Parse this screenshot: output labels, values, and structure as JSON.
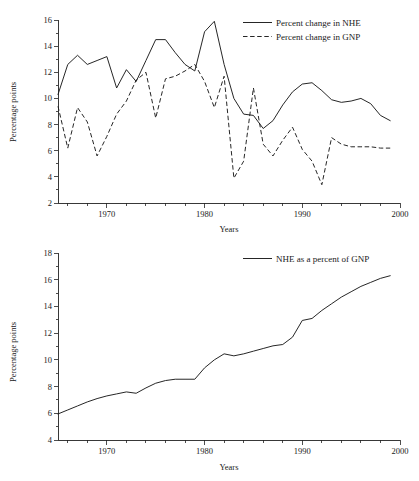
{
  "page": {
    "background": "#ffffff",
    "ink": "#1a1a1a",
    "partial_title_top": ""
  },
  "chart_data": [
    {
      "id": "top",
      "type": "line",
      "title": "",
      "xlabel": "Years",
      "ylabel": "Percentage points",
      "xlim": [
        1965,
        2000
      ],
      "ylim": [
        2,
        16
      ],
      "yticks": [
        2,
        4,
        6,
        8,
        10,
        12,
        14,
        16
      ],
      "xticks_major": [
        1970,
        1980,
        1990,
        2000
      ],
      "xticks_minor_step": 2,
      "grid": false,
      "legend_position": "top-right",
      "x": [
        1965,
        1966,
        1967,
        1968,
        1969,
        1970,
        1971,
        1972,
        1973,
        1974,
        1975,
        1976,
        1977,
        1978,
        1979,
        1980,
        1981,
        1982,
        1983,
        1984,
        1985,
        1986,
        1987,
        1988,
        1989,
        1990,
        1991,
        1992,
        1993,
        1994,
        1995,
        1996,
        1997,
        1998,
        1999
      ],
      "series": [
        {
          "name": "Percent change in NHE",
          "style": "solid",
          "values": [
            10.3,
            12.6,
            13.3,
            12.6,
            12.9,
            13.2,
            10.8,
            12.2,
            11.3,
            12.9,
            14.5,
            14.5,
            13.5,
            12.6,
            12.1,
            15.1,
            15.9,
            12.6,
            10.0,
            8.8,
            8.7,
            7.7,
            8.3,
            9.5,
            10.5,
            11.1,
            11.2,
            10.6,
            9.9,
            9.7,
            9.8,
            10.0,
            9.6,
            8.7,
            8.3
          ]
        },
        {
          "name": "Percent change in GNP",
          "style": "dashed",
          "values": [
            9.4,
            6.2,
            9.3,
            8.2,
            5.6,
            7.1,
            8.8,
            9.8,
            11.4,
            12.0,
            8.5,
            11.5,
            11.7,
            12.1,
            12.6,
            11.3,
            9.3,
            11.7,
            3.9,
            5.2,
            10.8,
            6.5,
            5.6,
            6.8,
            7.8,
            6.1,
            5.2,
            3.4,
            7.0,
            6.5,
            6.3,
            6.3,
            6.3,
            6.2,
            6.2
          ]
        }
      ]
    },
    {
      "id": "bottom",
      "type": "line",
      "title": "",
      "xlabel": "Years",
      "ylabel": "Percentage points",
      "xlim": [
        1965,
        2000
      ],
      "ylim": [
        4,
        18
      ],
      "yticks": [
        4,
        6,
        8,
        10,
        12,
        14,
        16,
        18
      ],
      "yticks_minor": [
        5,
        7,
        9,
        11,
        13,
        15,
        17
      ],
      "xticks_major": [
        1970,
        1980,
        1990,
        2000
      ],
      "xticks_minor_step": 2,
      "grid": false,
      "legend_position": "top-right",
      "x": [
        1965,
        1966,
        1967,
        1968,
        1969,
        1970,
        1971,
        1972,
        1973,
        1974,
        1975,
        1976,
        1977,
        1978,
        1979,
        1980,
        1981,
        1982,
        1983,
        1984,
        1985,
        1986,
        1987,
        1988,
        1989,
        1990,
        1991,
        1992,
        1993,
        1994,
        1995,
        1996,
        1997,
        1998,
        1999
      ],
      "series": [
        {
          "name": "NHE as a percent of GNP",
          "style": "solid",
          "values": [
            5.95,
            6.25,
            6.55,
            6.85,
            7.1,
            7.3,
            7.45,
            7.6,
            7.5,
            7.9,
            8.25,
            8.45,
            8.55,
            8.55,
            8.55,
            9.4,
            10.0,
            10.45,
            10.3,
            10.45,
            10.65,
            10.85,
            11.05,
            11.15,
            11.7,
            12.95,
            13.1,
            13.7,
            14.2,
            14.7,
            15.1,
            15.5,
            15.8,
            16.1,
            16.3
          ]
        }
      ]
    }
  ],
  "top_chart": {
    "ylabel": "Percentage points",
    "xlabel": "Years",
    "ytick_labels": [
      "2",
      "4",
      "6",
      "8",
      "10",
      "12",
      "14",
      "16"
    ],
    "xtick_labels": [
      "1970",
      "1980",
      "1990",
      "2000"
    ],
    "legend": [
      {
        "label": "Percent change in NHE",
        "style": "solid"
      },
      {
        "label": "Percent change in GNP",
        "style": "dashed"
      }
    ]
  },
  "bottom_chart": {
    "ylabel": "Percentage points",
    "xlabel": "Years",
    "ytick_labels": [
      "4",
      "6",
      "8",
      "10",
      "12",
      "14",
      "16",
      "18"
    ],
    "xtick_labels": [
      "1970",
      "1980",
      "1990",
      "2000"
    ],
    "legend": [
      {
        "label": "NHE as a percent of GNP",
        "style": "solid"
      }
    ]
  }
}
